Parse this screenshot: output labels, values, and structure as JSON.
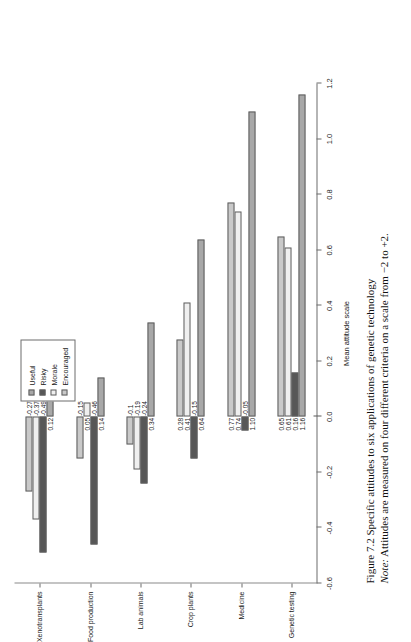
{
  "figure": {
    "caption_title": "Figure 7.2 Specific attitudes to six applications of genetic technology",
    "caption_note_lead": "Note:",
    "caption_note_text": " Attitudes are measured on four different criteria on a scale from −2 to +2."
  },
  "legend": {
    "items": [
      {
        "label": "Useful",
        "color": "#a8a8a8"
      },
      {
        "label": "Risky",
        "color": "#575757"
      },
      {
        "label": "Morale",
        "color": "#efefef"
      },
      {
        "label": "Encouraged",
        "color": "#c9c9c9"
      }
    ]
  },
  "chart_data": {
    "type": "bar",
    "orientation": "horizontal",
    "title": "",
    "xlabel": "Mean attitude scale",
    "ylabel": "",
    "xlim": [
      -0.6,
      1.2
    ],
    "xticks": [
      "1.2",
      "1.0",
      "0.8",
      "0.6",
      "0.4",
      "0.2",
      "0.0",
      "-0.2",
      "-0.4",
      "-0.6"
    ],
    "xtick_values": [
      1.2,
      1.0,
      0.8,
      0.6,
      0.4,
      0.2,
      0.0,
      -0.2,
      -0.4,
      -0.6
    ],
    "grid": false,
    "legend_position": "top-right",
    "categories": [
      "Xenotransplants",
      "Food production",
      "Lab animals",
      "Crop plants",
      "Medicine",
      "Genetic testing"
    ],
    "series": [
      {
        "name": "Useful",
        "color": "#a8a8a8",
        "values": [
          0.12,
          0.14,
          0.34,
          0.64,
          1.1,
          1.16
        ]
      },
      {
        "name": "Risky",
        "color": "#575757",
        "values": [
          -0.49,
          -0.46,
          -0.24,
          -0.15,
          -0.05,
          0.16
        ]
      },
      {
        "name": "Morale",
        "color": "#efefef",
        "values": [
          -0.37,
          0.05,
          -0.19,
          0.41,
          0.74,
          0.61
        ]
      },
      {
        "name": "Encouraged",
        "color": "#c9c9c9",
        "values": [
          -0.27,
          -0.15,
          -0.1,
          0.28,
          0.77,
          0.65
        ]
      }
    ],
    "data_labels": [
      {
        "category": "Xenotransplants",
        "series": "Useful",
        "text": "0.12"
      },
      {
        "category": "Xenotransplants",
        "series": "Risky",
        "text": "-0.49"
      },
      {
        "category": "Xenotransplants",
        "series": "Morale",
        "text": "-0.37"
      },
      {
        "category": "Xenotransplants",
        "series": "Encouraged",
        "text": "-0.27"
      },
      {
        "category": "Food production",
        "series": "Useful",
        "text": "0.14"
      },
      {
        "category": "Food production",
        "series": "Risky",
        "text": "-0.46"
      },
      {
        "category": "Food production",
        "series": "Morale",
        "text": "0.05"
      },
      {
        "category": "Food production",
        "series": "Encouraged",
        "text": "-0.15"
      },
      {
        "category": "Lab animals",
        "series": "Useful",
        "text": "0.34"
      },
      {
        "category": "Lab animals",
        "series": "Risky",
        "text": "-0.24"
      },
      {
        "category": "Lab animals",
        "series": "Morale",
        "text": "-0.19"
      },
      {
        "category": "Lab animals",
        "series": "Encouraged",
        "text": "-0.1"
      },
      {
        "category": "Crop plants",
        "series": "Useful",
        "text": "0.64"
      },
      {
        "category": "Crop plants",
        "series": "Risky",
        "text": "-0.15"
      },
      {
        "category": "Crop plants",
        "series": "Morale",
        "text": "0.41"
      },
      {
        "category": "Crop plants",
        "series": "Encouraged",
        "text": "0.28"
      },
      {
        "category": "Medicine",
        "series": "Useful",
        "text": "1.10"
      },
      {
        "category": "Medicine",
        "series": "Risky",
        "text": "-0.05"
      },
      {
        "category": "Medicine",
        "series": "Morale",
        "text": "0.74"
      },
      {
        "category": "Medicine",
        "series": "Encouraged",
        "text": "0.77"
      },
      {
        "category": "Genetic testing",
        "series": "Useful",
        "text": "1.16"
      },
      {
        "category": "Genetic testing",
        "series": "Risky",
        "text": "0.16"
      },
      {
        "category": "Genetic testing",
        "series": "Morale",
        "text": "0.61"
      },
      {
        "category": "Genetic testing",
        "series": "Encouraged",
        "text": "0.65"
      }
    ]
  }
}
